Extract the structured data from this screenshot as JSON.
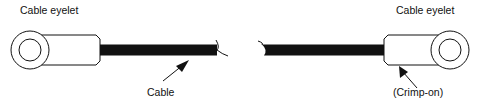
{
  "diagram": {
    "labels": {
      "left_eyelet": "Cable eyelet",
      "right_eyelet": "Cable eyelet",
      "cable": "Cable",
      "crimp": "(Crimp-on)"
    },
    "colors": {
      "stroke": "#111111",
      "cable": "#111111",
      "background": "#ffffff"
    }
  }
}
